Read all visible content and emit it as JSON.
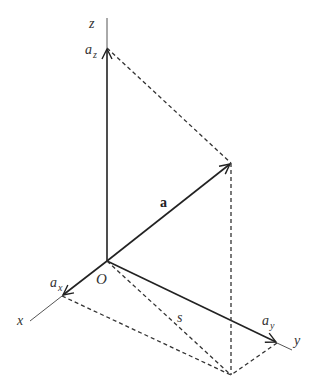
{
  "diagram": {
    "labels": {
      "z_axis": "z",
      "x_axis": "x",
      "y_axis": "y",
      "origin": "O",
      "vector": "a",
      "component_x": "a",
      "component_x_sub": "x",
      "component_y": "a",
      "component_y_sub": "y",
      "component_z": "a",
      "component_z_sub": "z",
      "projection": "s"
    },
    "colors": {
      "line": "#222222",
      "axis": "#555555",
      "dashed": "#333333"
    }
  }
}
